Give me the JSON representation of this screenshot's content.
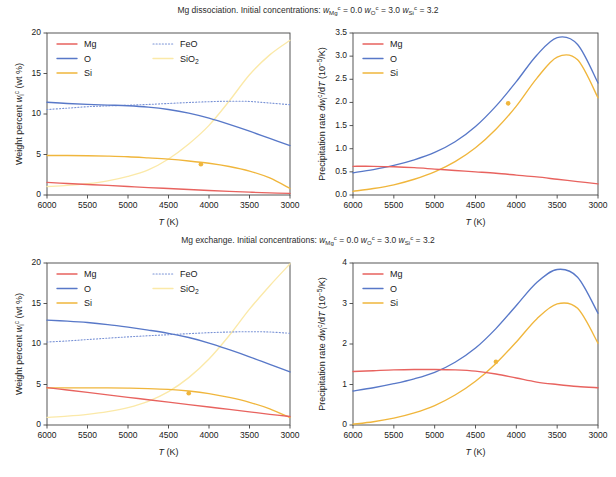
{
  "figure": {
    "background": "#ffffff",
    "colors": {
      "Mg": "#e8635f",
      "O": "#5878c8",
      "Si": "#f0b63c",
      "FeO": "#7a93d6",
      "SiO2": "#fbe9a8",
      "axis": "#444444",
      "text": "#1a1a1a"
    }
  },
  "panels": [
    {
      "id": "top-left",
      "title": "Mg dissociation. Initial concentrations: w_Mg^c = 0.0  w_O^c = 3.0  w_Si^c = 3.2",
      "xlabel": "T (K)",
      "ylabel": "Weight percent w_i^c (wt %)",
      "xticks": [
        "6000",
        "5500",
        "5000",
        "4500",
        "4000",
        "3500",
        "3000"
      ],
      "yticks": [
        "0",
        "5",
        "10",
        "15",
        "20"
      ],
      "legend": [
        "Mg",
        "O",
        "Si",
        "FeO",
        "SiO2"
      ]
    },
    {
      "id": "top-right",
      "xlabel": "T (K)",
      "ylabel": "Precipitation rate dw_i^c/dT (10^-5/K)",
      "xticks": [
        "6000",
        "5500",
        "5000",
        "4500",
        "4000",
        "3500",
        "3000"
      ],
      "yticks": [
        "0.0",
        "0.5",
        "1.0",
        "1.5",
        "2.0",
        "2.5",
        "3.0",
        "3.5"
      ],
      "legend": [
        "Mg",
        "O",
        "Si"
      ]
    },
    {
      "id": "bottom-left",
      "title": "Mg exchange. Initial concentrations: w_Mg^c = 0.0  w_O^c = 3.0  w_Si^c = 3.2",
      "xlabel": "T (K)",
      "ylabel": "Weight percent w_i^c (wt %)",
      "xticks": [
        "6000",
        "5500",
        "5000",
        "4500",
        "4000",
        "3500",
        "3000"
      ],
      "yticks": [
        "0",
        "5",
        "10",
        "15",
        "20"
      ],
      "legend": [
        "Mg",
        "O",
        "Si",
        "FeO",
        "SiO2"
      ]
    },
    {
      "id": "bottom-right",
      "xlabel": "T (K)",
      "ylabel": "Precipitation rate dw_i^c/dT (10^-5/K)",
      "xticks": [
        "6000",
        "5500",
        "5000",
        "4500",
        "4000",
        "3500",
        "3000"
      ],
      "yticks": [
        "0",
        "1",
        "2",
        "3",
        "4"
      ],
      "legend": [
        "Mg",
        "O",
        "Si"
      ]
    }
  ],
  "titles": {
    "top": {
      "prefix": "Mg dissociation. Initial concentrations: ",
      "t1_sub": "Mg",
      "t1_sup": "c",
      "t1_val": " = 0.0 ",
      "t2_sub": "O",
      "t2_sup": "c",
      "t2_val": " = 3.0 ",
      "t3_sub": "Si",
      "t3_sup": "c",
      "t3_val": " = 3.2"
    },
    "bottom": {
      "prefix": "Mg exchange. Initial concentrations: ",
      "t1_sub": "Mg",
      "t1_sup": "c",
      "t1_val": " = 0.0 ",
      "t2_sub": "O",
      "t2_sup": "c",
      "t2_val": " = 3.0 ",
      "t3_sub": "Si",
      "t3_sup": "c",
      "t3_val": " = 3.2"
    }
  },
  "labels": {
    "xlabel_T": "T",
    "xlabel_unit": " (K)",
    "weight_percent": "Weight percent ",
    "w_sym": "w",
    "w_sub": "i",
    "w_sup": "c",
    "wt_unit": " (wt %)",
    "precip_rate": "Precipitation rate ",
    "d_sym": "d",
    "w_sym2": "w",
    "dT": "/d",
    "T_sym": "T",
    "rate_unit_open": " (10",
    "rate_unit_exp": "−5",
    "rate_unit_close": "/K)"
  },
  "legend_labels": {
    "Mg": "Mg",
    "O": "O",
    "Si": "Si",
    "FeO": "FeO",
    "SiO2_pre": "SiO",
    "SiO2_sub": "2"
  },
  "chart_data": {
    "type": "line",
    "shared_x": [
      6000,
      5750,
      5500,
      5250,
      5000,
      4750,
      4500,
      4250,
      4000,
      3750,
      3500,
      3250,
      3000
    ],
    "x_reversed": true,
    "subplots": [
      {
        "id": "top-left",
        "title": "Mg dissociation. Initial concentrations: w_Mg^c = 0.0 w_O^c = 3.0 w_Si^c = 3.2",
        "xlabel": "T (K)",
        "ylabel": "Weight percent w_i^c (wt %)",
        "xlim": [
          6000,
          3000
        ],
        "ylim": [
          0,
          20
        ],
        "grid": false,
        "legend_position": "upper-left",
        "series": [
          {
            "name": "Mg",
            "color": "#e8635f",
            "style": "solid",
            "values": [
              1.55,
              1.42,
              1.3,
              1.18,
              1.05,
              0.92,
              0.8,
              0.68,
              0.56,
              0.45,
              0.35,
              0.26,
              0.2
            ]
          },
          {
            "name": "O",
            "color": "#5878c8",
            "style": "solid",
            "values": [
              11.45,
              11.3,
              11.18,
              11.1,
              11.02,
              10.85,
              10.55,
              10.1,
              9.48,
              8.72,
              7.88,
              6.98,
              6.1
            ]
          },
          {
            "name": "Si",
            "color": "#f0b63c",
            "style": "solid",
            "marker_x": 4100,
            "marker_y": 3.8,
            "values": [
              4.88,
              4.88,
              4.85,
              4.8,
              4.72,
              4.58,
              4.42,
              4.2,
              3.92,
              3.52,
              2.95,
              2.1,
              0.8
            ]
          },
          {
            "name": "FeO",
            "color": "#7a93d6",
            "style": "dotted",
            "values": [
              10.55,
              10.72,
              10.9,
              11.0,
              11.08,
              11.18,
              11.3,
              11.42,
              11.52,
              11.58,
              11.55,
              11.35,
              11.15
            ]
          },
          {
            "name": "SiO2",
            "color": "#fbe9a8",
            "style": "solid",
            "values": [
              1.05,
              1.18,
              1.4,
              1.75,
              2.3,
              3.1,
              4.45,
              6.3,
              8.6,
              11.6,
              14.85,
              17.3,
              19.1
            ]
          }
        ]
      },
      {
        "id": "top-right",
        "xlabel": "T (K)",
        "ylabel": "Precipitation rate dw_i^c/dT (10^-5/K)",
        "xlim": [
          6000,
          3000
        ],
        "ylim": [
          0.0,
          3.5
        ],
        "grid": false,
        "legend_position": "upper-left",
        "series": [
          {
            "name": "Mg",
            "color": "#e8635f",
            "style": "solid",
            "values": [
              0.62,
              0.62,
              0.61,
              0.59,
              0.56,
              0.53,
              0.5,
              0.47,
              0.43,
              0.39,
              0.34,
              0.29,
              0.24
            ]
          },
          {
            "name": "O",
            "color": "#5878c8",
            "style": "solid",
            "values": [
              0.48,
              0.55,
              0.64,
              0.76,
              0.92,
              1.15,
              1.48,
              1.92,
              2.45,
              3.02,
              3.4,
              3.25,
              2.42
            ]
          },
          {
            "name": "Si",
            "color": "#f0b63c",
            "style": "solid",
            "marker_x": 4100,
            "marker_y": 1.98,
            "values": [
              0.08,
              0.14,
              0.22,
              0.34,
              0.5,
              0.72,
              1.02,
              1.42,
              1.92,
              2.52,
              2.98,
              2.92,
              2.1
            ]
          }
        ]
      },
      {
        "id": "bottom-left",
        "title": "Mg exchange. Initial concentrations: w_Mg^c = 0.0 w_O^c = 3.0 w_Si^c = 3.2",
        "xlabel": "T (K)",
        "ylabel": "Weight percent w_i^c (wt %)",
        "xlim": [
          6000,
          3000
        ],
        "ylim": [
          0,
          20
        ],
        "grid": false,
        "legend_position": "upper-left",
        "series": [
          {
            "name": "Mg",
            "color": "#e8635f",
            "style": "solid",
            "values": [
              4.62,
              4.32,
              4.02,
              3.72,
              3.42,
              3.12,
              2.82,
              2.52,
              2.22,
              1.92,
              1.62,
              1.32,
              1.05
            ]
          },
          {
            "name": "O",
            "color": "#5878c8",
            "style": "solid",
            "values": [
              12.95,
              12.82,
              12.65,
              12.4,
              12.08,
              11.72,
              11.32,
              10.8,
              10.12,
              9.3,
              8.42,
              7.48,
              6.55
            ]
          },
          {
            "name": "Si",
            "color": "#f0b63c",
            "style": "solid",
            "marker_x": 4250,
            "marker_y": 3.92,
            "values": [
              4.58,
              4.58,
              4.58,
              4.58,
              4.55,
              4.5,
              4.4,
              4.2,
              3.88,
              3.4,
              2.8,
              2.0,
              0.92
            ]
          },
          {
            "name": "FeO",
            "color": "#7a93d6",
            "style": "dotted",
            "values": [
              10.25,
              10.38,
              10.55,
              10.72,
              10.88,
              11.02,
              11.15,
              11.28,
              11.4,
              11.48,
              11.52,
              11.48,
              11.32
            ]
          },
          {
            "name": "SiO2",
            "color": "#fbe9a8",
            "style": "solid",
            "values": [
              0.95,
              1.1,
              1.32,
              1.65,
              2.15,
              2.92,
              4.12,
              5.85,
              8.15,
              11.05,
              14.3,
              17.2,
              19.9
            ]
          }
        ]
      },
      {
        "id": "bottom-right",
        "xlabel": "T (K)",
        "ylabel": "Precipitation rate dw_i^c/dT (10^-5/K)",
        "xlim": [
          6000,
          3000
        ],
        "ylim": [
          0,
          4
        ],
        "grid": false,
        "legend_position": "upper-left",
        "series": [
          {
            "name": "Mg",
            "color": "#e8635f",
            "style": "solid",
            "values": [
              1.32,
              1.34,
              1.36,
              1.37,
              1.37,
              1.36,
              1.33,
              1.26,
              1.16,
              1.06,
              1.0,
              0.95,
              0.92
            ]
          },
          {
            "name": "O",
            "color": "#5878c8",
            "style": "solid",
            "values": [
              0.84,
              0.92,
              1.02,
              1.14,
              1.3,
              1.55,
              1.9,
              2.38,
              2.95,
              3.52,
              3.84,
              3.65,
              2.76
            ]
          },
          {
            "name": "Si",
            "color": "#f0b63c",
            "style": "solid",
            "marker_x": 4250,
            "marker_y": 1.56,
            "values": [
              0.02,
              0.08,
              0.17,
              0.3,
              0.48,
              0.74,
              1.08,
              1.52,
              2.05,
              2.62,
              2.99,
              2.88,
              2.02
            ]
          }
        ]
      }
    ]
  }
}
